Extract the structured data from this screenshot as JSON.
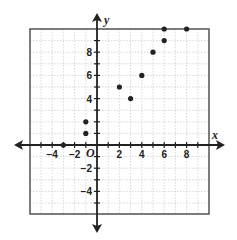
{
  "chart_data": {
    "type": "scatter",
    "title": "",
    "xlabel": "x",
    "ylabel": "y",
    "origin_label": "O",
    "xlim": [
      -6,
      10
    ],
    "ylim": [
      -6,
      10
    ],
    "grid": true,
    "x_tick_labels": [
      "-4",
      "-2",
      "2",
      "4",
      "6",
      "8"
    ],
    "y_tick_labels": [
      "8",
      "6",
      "4",
      "-2",
      "-4"
    ],
    "points": [
      {
        "x": -3,
        "y": 0
      },
      {
        "x": -1,
        "y": 1
      },
      {
        "x": -1,
        "y": 2
      },
      {
        "x": 2,
        "y": 5
      },
      {
        "x": 3,
        "y": 4
      },
      {
        "x": 4,
        "y": 6
      },
      {
        "x": 5,
        "y": 8
      },
      {
        "x": 6,
        "y": 9
      },
      {
        "x": 6,
        "y": 10
      },
      {
        "x": 8,
        "y": 10
      }
    ],
    "colors": {
      "grid": "#bdbdbd",
      "axis": "#222222",
      "point": "#222222",
      "frame": "#555555"
    }
  }
}
